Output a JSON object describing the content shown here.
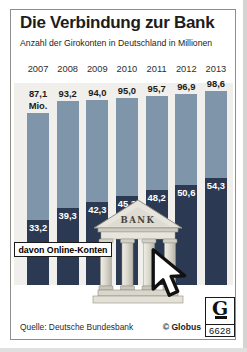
{
  "title": "Die Verbindung zur Bank",
  "subtitle": "Anzahl der Girokonten in Deutschland in Millionen",
  "chart_data": {
    "type": "bar",
    "categories": [
      "2007",
      "2008",
      "2009",
      "2010",
      "2011",
      "2012",
      "2013"
    ],
    "series": [
      {
        "name": "Girokonten",
        "values": [
          87.1,
          93.2,
          94.0,
          95.0,
          95.7,
          96.9,
          98.6
        ]
      },
      {
        "name": "davon Online-Konten",
        "values": [
          33.2,
          39.3,
          42.3,
          45.3,
          48.2,
          50.6,
          54.3
        ]
      }
    ],
    "value_labels_total": [
      "87,1",
      "93,2",
      "94,0",
      "95,0",
      "95,7",
      "96,9",
      "98,6"
    ],
    "value_labels_online": [
      "33,2",
      "39,3",
      "42,3",
      "45,3",
      "48,2",
      "50,6",
      "54,3"
    ],
    "unit_label": "Mio.",
    "annotation": "davon Online-Konten",
    "ylim": [
      0,
      100
    ],
    "grid": false,
    "legend_position": "none",
    "colors": {
      "total": "#7e95aa",
      "online": "#2b3a52",
      "plot_bg": "#f0efeb"
    }
  },
  "bank_label": "BANK",
  "footer": {
    "source": "Quelle: Deutsche Bundesbank",
    "copyright": "© Globus",
    "logo_letter": "G",
    "logo_number": "6628"
  }
}
